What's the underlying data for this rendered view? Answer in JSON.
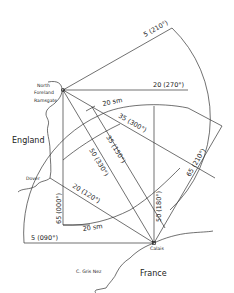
{
  "places": {
    "north_foreland": "North",
    "north_foreland_2": "Foreland",
    "ramsgate": "Ramsgate",
    "dover": "Dover",
    "calais": "Calais",
    "gris_nez": "C. Gris Nez",
    "england": "England",
    "france": "France"
  },
  "labels": {
    "l_5_210": "5 (210°)",
    "l_20_270": "20 (270°)",
    "l_20sm_top": "20 sm",
    "l_35_300": "35 (300°)",
    "l_35_150": "35 (150°)",
    "l_50_330": "50 (330°)",
    "l_20_120": "20 (120°)",
    "l_65_000": "65 (000°)",
    "l_20sm_bottom": "20 sm",
    "l_5_090": "5 (090°)",
    "l_50_180": "50 (180°)",
    "l_65_210": "65 (210°)"
  }
}
